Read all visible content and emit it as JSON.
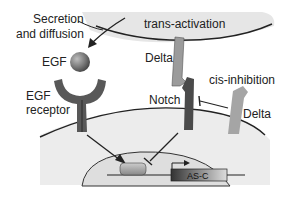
{
  "labels": {
    "secretion": "Secretion",
    "diffusion": "and diffusion",
    "egf": "EGF",
    "egf_receptor_line1": "EGF",
    "egf_receptor_line2": "receptor",
    "trans_activation": "trans-activation",
    "delta_top": "Delta",
    "notch": "Notch",
    "cis_inhibition": "cis-inhibition",
    "delta_right": "Delta",
    "gene": "AS-C"
  },
  "colors": {
    "cell_fill": "#ededed",
    "nucleus_fill": "#e2e2e2",
    "receptor": "#595959",
    "notch": "#4a4a4a",
    "delta": "#9a9a9a",
    "membrane": "#222222"
  }
}
